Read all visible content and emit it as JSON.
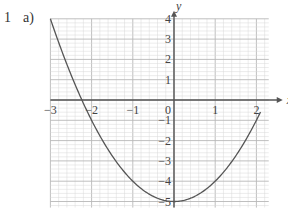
{
  "question": {
    "number": "1",
    "part": "a)"
  },
  "colors": {
    "grid_minor": "#d8d8d8",
    "grid_major": "#b8b8b8",
    "axis": "#555555",
    "curve": "#555555"
  },
  "chart_data": {
    "type": "line",
    "title": "",
    "xlabel": "x",
    "ylabel": "y",
    "xlim": [
      -3,
      2.3
    ],
    "ylim": [
      -5.3,
      4
    ],
    "grid": true,
    "x_ticks": [
      "-3",
      "-2",
      "-1",
      "0",
      "1",
      "2"
    ],
    "y_ticks": [
      "4",
      "3",
      "2",
      "1",
      "-1",
      "-2",
      "-3",
      "-4",
      "-5"
    ],
    "origin_label": "0",
    "series": [
      {
        "name": "y = x^2 - 5",
        "x": [
          -3,
          -2.5,
          -2,
          -1.5,
          -1,
          -0.5,
          0,
          0.5,
          1,
          1.5,
          2,
          2.1
        ],
        "values": [
          4,
          1.25,
          -1,
          -2.75,
          -4,
          -4.75,
          -5,
          -4.75,
          -4,
          -2.75,
          -1,
          -0.59
        ]
      }
    ]
  }
}
